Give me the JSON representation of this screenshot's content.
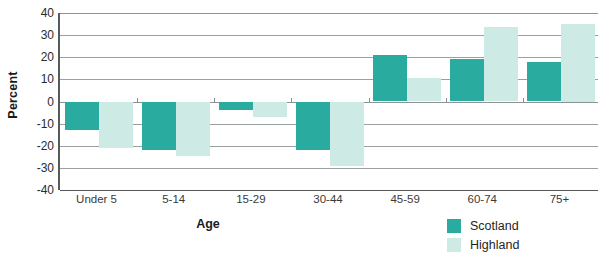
{
  "chart_data": {
    "type": "bar",
    "title": "",
    "xlabel": "Age",
    "ylabel": "Percent",
    "categories": [
      "Under 5",
      "5-14",
      "15-29",
      "30-44",
      "45-59",
      "60-74",
      "75+"
    ],
    "series": [
      {
        "name": "Scotland",
        "color": "#2aab9f",
        "values": [
          -13,
          -22,
          -4,
          -22,
          21,
          19,
          18
        ]
      },
      {
        "name": "Highland",
        "color": "#cdeae5",
        "values": [
          -21,
          -24.5,
          -7,
          -29,
          10.5,
          33.5,
          35
        ]
      }
    ],
    "ylim": [
      -40,
      40
    ],
    "yticks": [
      40,
      30,
      20,
      10,
      0,
      -10,
      -20,
      -30,
      -40
    ],
    "ytick_labels": [
      "40",
      "30",
      "20",
      "10",
      "0",
      "-10",
      "-20",
      "-30",
      "-40"
    ],
    "grid": true,
    "legend_position": "bottom-right",
    "orientation": "vertical",
    "bar_mode": "grouped"
  },
  "axes": {
    "y_title": "Percent",
    "x_title": "Age"
  },
  "legend": {
    "items": [
      {
        "label": "Scotland",
        "color": "#2aab9f"
      },
      {
        "label": "Highland",
        "color": "#cdeae5"
      }
    ]
  }
}
